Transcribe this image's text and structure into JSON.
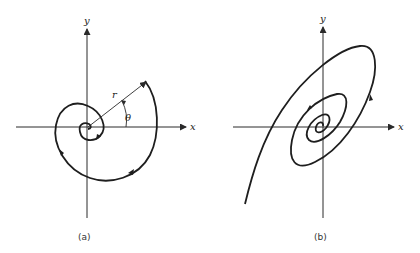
{
  "panels": [
    {
      "id": "a",
      "caption": "(a)",
      "axis_labels": {
        "x": "x",
        "y": "y"
      },
      "annotations": {
        "radius": "r",
        "angle": "θ"
      },
      "description": "Spiral trajectory winding inward toward the origin in polar coordinates, with radius r and angle θ marked"
    },
    {
      "id": "b",
      "caption": "(b)",
      "axis_labels": {
        "x": "x",
        "y": "y"
      },
      "description": "Tilted elliptical spiral trajectory winding inward toward the origin"
    }
  ],
  "colors": {
    "ink": "#1e1e1e",
    "background": "#ffffff"
  }
}
